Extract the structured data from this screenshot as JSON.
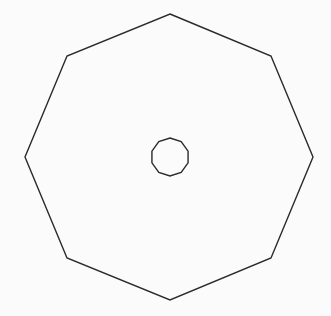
{
  "diagram": {
    "background": "#fbfbfb",
    "stroke_color": "#2a2a2a",
    "outer_polygon": {
      "sides": 8,
      "stroke_width": 1.4,
      "points": [
        [
          170,
          14
        ],
        [
          271,
          56
        ],
        [
          313,
          157
        ],
        [
          271,
          258
        ],
        [
          170,
          300
        ],
        [
          67,
          258
        ],
        [
          25,
          157
        ],
        [
          67,
          56
        ]
      ]
    },
    "inner_polygon": {
      "sides": 10,
      "center": [
        170,
        157
      ],
      "radius": 19,
      "stroke_width": 1.4
    }
  }
}
